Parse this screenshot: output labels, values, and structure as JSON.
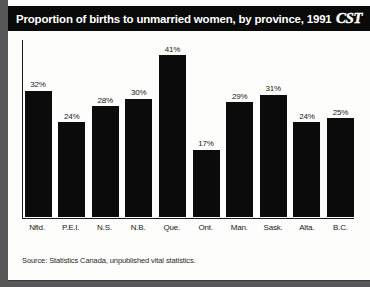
{
  "header": {
    "title": "Proportion of births to unmarried women, by province, 1991",
    "logo": "CST",
    "logo_name": "cst-logo"
  },
  "source_note": "Source: Statistics Canada, unpublished vital statistics.",
  "colors": {
    "bar": "#0b0b0b",
    "titlebar_bg": "#0a0a0a",
    "titlebar_text": "#ffffff",
    "card_bg": "#fdfdfb",
    "page_bg": "#57575a",
    "axis": "#1a1a1a"
  },
  "chart_data": {
    "type": "bar",
    "title": "Proportion of births to unmarried women, by province, 1991",
    "xlabel": "",
    "ylabel": "",
    "ylim": [
      0,
      45
    ],
    "grid": false,
    "legend": false,
    "categories": [
      "Nfld.",
      "P.E.I.",
      "N.S.",
      "N.B.",
      "Que.",
      "Ont.",
      "Man.",
      "Sask.",
      "Alta.",
      "B.C."
    ],
    "values": [
      32,
      24,
      28,
      30,
      41,
      17,
      29,
      31,
      24,
      25
    ],
    "value_labels": [
      "32%",
      "24%",
      "28%",
      "30%",
      "41%",
      "17%",
      "29%",
      "31%",
      "24%",
      "25%"
    ],
    "units": "percent",
    "annotations": [
      "Source: Statistics Canada, unpublished vital statistics."
    ]
  }
}
